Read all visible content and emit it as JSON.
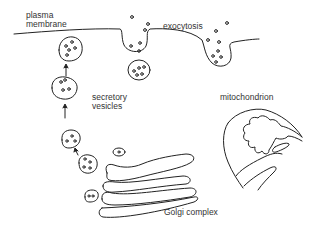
{
  "diagram": {
    "type": "cell secretion pathway illustration",
    "labels": {
      "plasma_membrane_line1": "plasma",
      "plasma_membrane_line2": "membrane",
      "exocytosis": "exocytosis",
      "secretory_vesicles_line1": "secretory",
      "secretory_vesicles_line2": "vesicles",
      "mitochondrion": "mitochondrion",
      "golgi_complex": "Golgi complex"
    },
    "colors": {
      "stroke": "#222222",
      "text": "#333333",
      "background": "#ffffff"
    }
  }
}
